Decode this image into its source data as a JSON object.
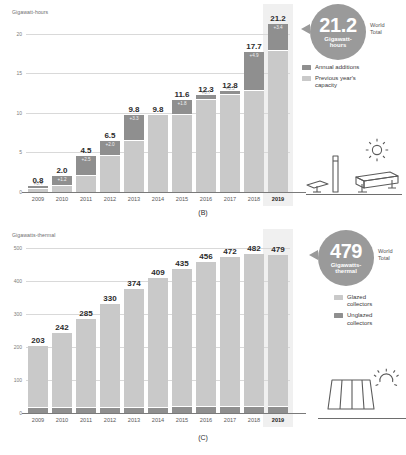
{
  "panel_b": {
    "caption": "(B)",
    "axis_title": "Gigawatt-hours",
    "yticks": [
      "0",
      "5",
      "10",
      "15",
      "20"
    ],
    "callout": {
      "value": "21.2",
      "unit": "Gigawatt-\nhours",
      "unit_line1": "Gigawatt-",
      "unit_line2": "hours",
      "world": "World",
      "total": "Total"
    },
    "legend": [
      {
        "label": "Annual additions",
        "color": "#8f8f8f",
        "key": "annual-additions"
      },
      {
        "label": "Previous year's\ncapacity",
        "line1": "Previous year's",
        "line2": "capacity",
        "color": "#c9c9c9",
        "key": "previous-years-capacity"
      }
    ],
    "icons": [
      "solar-panel-icon",
      "pole-icon",
      "sun-icon",
      "battery-storage-icon"
    ]
  },
  "panel_c": {
    "caption": "(C)",
    "axis_title": "Gigawatts-thermal",
    "yticks": [
      "0",
      "100",
      "200",
      "300",
      "400",
      "500"
    ],
    "callout": {
      "value": "479",
      "unit_line1": "Gigawatts-",
      "unit_line2": "thermal",
      "world": "World",
      "total": "Total"
    },
    "legend": [
      {
        "label": "Glazed collectors",
        "line1": "Glazed",
        "line2": "collectors",
        "color": "#c9c9c9",
        "key": "glazed-collectors"
      },
      {
        "label": "Unglazed collectors",
        "line1": "Unglazed",
        "line2": "collectors",
        "color": "#8f8f8f",
        "key": "unglazed-collectors"
      }
    ],
    "icons": [
      "solar-thermal-collector-icon",
      "sun-icon"
    ]
  },
  "chart_data": [
    {
      "type": "bar",
      "title": "Global battery energy storage capacity",
      "panel": "(B)",
      "ylabel": "Gigawatt-hours",
      "xlabel": "",
      "ylim": [
        0,
        22
      ],
      "yticks": [
        0,
        5,
        10,
        15,
        20
      ],
      "grid": true,
      "legend_position": "right",
      "stacked": true,
      "categories": [
        "2009",
        "2010",
        "2011",
        "2012",
        "2013",
        "2014",
        "2015",
        "2016",
        "2017",
        "2018",
        "2019"
      ],
      "highlight_category": "2019",
      "totals": [
        0.8,
        2.0,
        4.5,
        6.5,
        9.8,
        9.8,
        11.6,
        12.3,
        12.8,
        17.7,
        21.2
      ],
      "total_labels": [
        "0.8",
        "2.0",
        "4.5",
        "6.5",
        "9.8",
        "9.8",
        "11.6",
        "12.3",
        "12.8",
        "17.7",
        "21.2"
      ],
      "series": [
        {
          "name": "Previous year's capacity",
          "color": "#c9c9c9",
          "values": [
            0.4,
            0.8,
            2.0,
            4.5,
            6.5,
            9.8,
            9.8,
            11.6,
            12.3,
            12.8,
            17.7
          ]
        },
        {
          "name": "Annual additions",
          "color": "#8f8f8f",
          "values": [
            0.4,
            1.2,
            2.5,
            2.0,
            3.3,
            0.0,
            1.8,
            0.7,
            0.5,
            4.9,
            3.4
          ],
          "labels": [
            "+0.4",
            "+1.2",
            "+2.5",
            "+2.0",
            "+3.3",
            "",
            "+1.8",
            "+0.7",
            "+0.5",
            "+4.9",
            "+3.4"
          ]
        }
      ]
    },
    {
      "type": "bar",
      "title": "Global solar thermal collector capacity",
      "panel": "(C)",
      "ylabel": "Gigawatts-thermal",
      "xlabel": "",
      "ylim": [
        0,
        520
      ],
      "yticks": [
        0,
        100,
        200,
        300,
        400,
        500
      ],
      "grid": true,
      "legend_position": "right",
      "stacked": true,
      "categories": [
        "2009",
        "2010",
        "2011",
        "2012",
        "2013",
        "2014",
        "2015",
        "2016",
        "2017",
        "2018",
        "2019"
      ],
      "highlight_category": "2019",
      "totals": [
        203,
        242,
        285,
        330,
        374,
        409,
        435,
        456,
        472,
        482,
        479
      ],
      "total_labels": [
        "203",
        "242",
        "285",
        "330",
        "374",
        "409",
        "435",
        "456",
        "472",
        "482",
        "479"
      ],
      "series": [
        {
          "name": "Glazed collectors",
          "color": "#c9c9c9",
          "values": [
            186,
            225,
            268,
            312,
            356,
            390,
            415,
            436,
            452,
            462,
            459
          ]
        },
        {
          "name": "Unglazed collectors",
          "color": "#8f8f8f",
          "values": [
            17,
            17,
            17,
            18,
            18,
            19,
            20,
            20,
            20,
            20,
            20
          ]
        }
      ]
    }
  ]
}
